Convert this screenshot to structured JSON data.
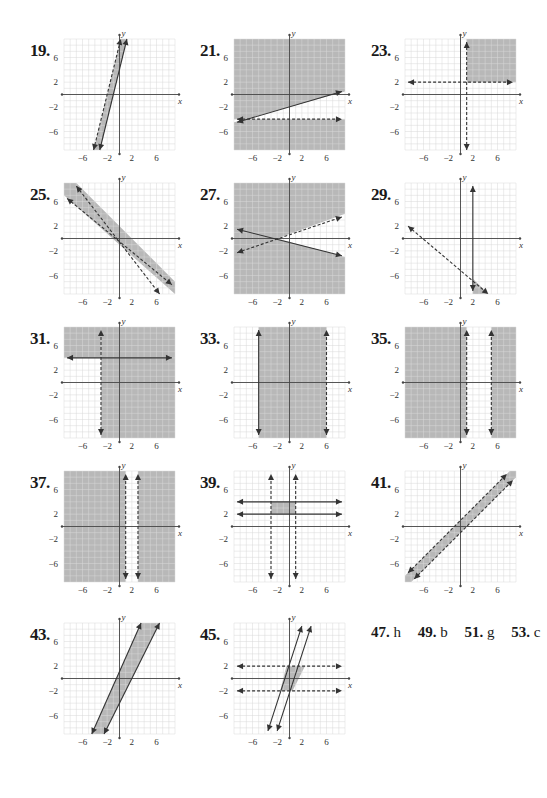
{
  "page": {
    "colors": {
      "shade": "#b8b8b8",
      "grid": "#d9d9d9",
      "axis": "#444444",
      "line": "#333333"
    }
  },
  "graph_settings": {
    "range": [
      -9,
      9
    ],
    "tick_labels_x": [
      "−6",
      "−2",
      "2",
      "6"
    ],
    "tick_values_x": [
      -6,
      -2,
      2,
      6
    ],
    "tick_labels_y": [
      "6",
      "2",
      "−2",
      "−6"
    ],
    "tick_values_y": [
      6,
      2,
      -2,
      -6
    ],
    "x_axis_label": "x",
    "y_axis_label": "y"
  },
  "problems": [
    {
      "number": "19.",
      "col": 0,
      "row": 0,
      "shade": [
        [
          [
            -4.2,
            -9
          ],
          [
            -3.2,
            -9
          ],
          [
            1.2,
            9
          ],
          [
            0.2,
            9
          ]
        ]
      ],
      "lines": [
        {
          "p1": [
            -4.2,
            -9
          ],
          "p2": [
            0.2,
            9
          ],
          "dashed": true
        },
        {
          "p1": [
            -3.2,
            -9
          ],
          "p2": [
            1.2,
            9
          ],
          "dashed": false
        }
      ]
    },
    {
      "number": "21.",
      "col": 1,
      "row": 0,
      "shade": [
        [
          [
            -9,
            9
          ],
          [
            9,
            9
          ],
          [
            9,
            0.5
          ],
          [
            -9,
            -4.5
          ],
          [
            -9,
            -4
          ]
        ],
        [
          [
            -9,
            -4.5
          ],
          [
            -9,
            -9
          ],
          [
            9,
            -9
          ],
          [
            9,
            -4
          ]
        ]
      ],
      "shade_full": true,
      "unshade": [
        [
          [
            -9,
            -4.5
          ],
          [
            9,
            0.5
          ],
          [
            9,
            -4
          ],
          [
            -9,
            -4
          ]
        ]
      ],
      "lines": [
        {
          "p1": [
            -8.5,
            -4.5
          ],
          "p2": [
            8.5,
            0.5
          ],
          "dashed": false
        },
        {
          "p1": [
            -8.5,
            -4
          ],
          "p2": [
            8.5,
            -4
          ],
          "dashed": true
        }
      ]
    },
    {
      "number": "23.",
      "col": 2,
      "row": 0,
      "shade": [
        [
          [
            1,
            2
          ],
          [
            9,
            2
          ],
          [
            9,
            9
          ],
          [
            1,
            9
          ]
        ]
      ],
      "lines": [
        {
          "p1": [
            -8.5,
            2
          ],
          "p2": [
            8.5,
            2
          ],
          "dashed": true
        },
        {
          "p1": [
            1,
            -9
          ],
          "p2": [
            1,
            8.5
          ],
          "dashed": true
        }
      ]
    },
    {
      "number": "25.",
      "col": 0,
      "row": 1,
      "shade": [
        [
          [
            -9,
            9
          ],
          [
            -7,
            9
          ],
          [
            9,
            -7
          ],
          [
            9,
            -9
          ],
          [
            -9,
            7
          ]
        ]
      ],
      "lines": [
        {
          "p1": [
            -7,
            8.5
          ],
          "p2": [
            6.5,
            -9
          ],
          "dashed": true
        },
        {
          "p1": [
            -8.5,
            6.5
          ],
          "p2": [
            8.5,
            -7.5
          ],
          "dashed": true
        }
      ]
    },
    {
      "number": "27.",
      "col": 1,
      "row": 1,
      "shade": [
        [
          [
            -9,
            9
          ],
          [
            9,
            9
          ],
          [
            9,
            4
          ],
          [
            -2,
            0
          ],
          [
            9,
            -3
          ],
          [
            9,
            -9
          ],
          [
            -9,
            -9
          ]
        ]
      ],
      "lines": [
        {
          "p1": [
            -8.5,
            1.5
          ],
          "p2": [
            8.5,
            -2.8
          ],
          "dashed": false
        },
        {
          "p1": [
            -8.5,
            -2.3
          ],
          "p2": [
            8.5,
            3.5
          ],
          "dashed": true
        }
      ]
    },
    {
      "number": "29.",
      "col": 2,
      "row": 1,
      "shade": [
        [
          [
            2,
            -6.5
          ],
          [
            2,
            -9
          ],
          [
            4.5,
            -9
          ]
        ]
      ],
      "lines": [
        {
          "p1": [
            -8.5,
            2
          ],
          "p2": [
            4.5,
            -9
          ],
          "dashed": true
        },
        {
          "p1": [
            2,
            -8.5
          ],
          "p2": [
            2,
            8.5
          ],
          "dashed": false
        }
      ]
    },
    {
      "number": "31.",
      "col": 0,
      "row": 2,
      "shade": [
        [
          [
            -9,
            9
          ],
          [
            9,
            9
          ],
          [
            9,
            -9
          ],
          [
            -3,
            -9
          ],
          [
            -3,
            4
          ],
          [
            -9,
            4
          ]
        ]
      ],
      "lines": [
        {
          "p1": [
            -3,
            -8.5
          ],
          "p2": [
            -3,
            8.5
          ],
          "dashed": true
        },
        {
          "p1": [
            -8.5,
            4
          ],
          "p2": [
            8.5,
            4
          ],
          "dashed": false
        }
      ]
    },
    {
      "number": "33.",
      "col": 1,
      "row": 2,
      "shade": [
        [
          [
            -5,
            9
          ],
          [
            6,
            9
          ],
          [
            6,
            -9
          ],
          [
            -5,
            -9
          ]
        ]
      ],
      "lines": [
        {
          "p1": [
            -5,
            -8.5
          ],
          "p2": [
            -5,
            8.5
          ],
          "dashed": false
        },
        {
          "p1": [
            6,
            -8.5
          ],
          "p2": [
            6,
            8.5
          ],
          "dashed": true
        }
      ]
    },
    {
      "number": "35.",
      "col": 2,
      "row": 2,
      "shade": [
        [
          [
            -9,
            9
          ],
          [
            1,
            9
          ],
          [
            1,
            -9
          ],
          [
            -9,
            -9
          ]
        ],
        [
          [
            5,
            9
          ],
          [
            9,
            9
          ],
          [
            9,
            -9
          ],
          [
            5,
            -9
          ]
        ]
      ],
      "lines": [
        {
          "p1": [
            1,
            -8.5
          ],
          "p2": [
            1,
            8.5
          ],
          "dashed": true
        },
        {
          "p1": [
            5,
            -8.5
          ],
          "p2": [
            5,
            8.5
          ],
          "dashed": true
        }
      ]
    },
    {
      "number": "37.",
      "col": 0,
      "row": 3,
      "shade": [
        [
          [
            -9,
            9
          ],
          [
            1,
            9
          ],
          [
            1,
            -9
          ],
          [
            -9,
            -9
          ]
        ],
        [
          [
            3,
            9
          ],
          [
            9,
            9
          ],
          [
            9,
            -9
          ],
          [
            3,
            -9
          ]
        ]
      ],
      "lines": [
        {
          "p1": [
            1,
            -8.5
          ],
          "p2": [
            1,
            8.5
          ],
          "dashed": true
        },
        {
          "p1": [
            3,
            -8.5
          ],
          "p2": [
            3,
            8.5
          ],
          "dashed": true
        }
      ]
    },
    {
      "number": "39.",
      "col": 1,
      "row": 3,
      "shade": [
        [
          [
            -3,
            2
          ],
          [
            1,
            2
          ],
          [
            1,
            4
          ],
          [
            -3,
            4
          ]
        ]
      ],
      "lines": [
        {
          "p1": [
            -3,
            -8.5
          ],
          "p2": [
            -3,
            8.5
          ],
          "dashed": true
        },
        {
          "p1": [
            1,
            -8.5
          ],
          "p2": [
            1,
            8.5
          ],
          "dashed": true
        },
        {
          "p1": [
            -8.5,
            4
          ],
          "p2": [
            8.5,
            4
          ],
          "dashed": false
        },
        {
          "p1": [
            -8.5,
            2
          ],
          "p2": [
            8.5,
            2
          ],
          "dashed": false
        }
      ]
    },
    {
      "number": "41.",
      "col": 2,
      "row": 3,
      "shade": [
        [
          [
            -9,
            -8
          ],
          [
            -9,
            -9
          ],
          [
            -8,
            -9
          ],
          [
            9,
            8
          ],
          [
            9,
            9
          ],
          [
            8,
            9
          ]
        ]
      ],
      "lines": [
        {
          "p1": [
            -8.5,
            -7.5
          ],
          "p2": [
            7.5,
            8.5
          ],
          "dashed": true
        },
        {
          "p1": [
            -7.5,
            -8.5
          ],
          "p2": [
            8.5,
            7.5
          ],
          "dashed": true
        }
      ]
    },
    {
      "number": "43.",
      "col": 0,
      "row": 4,
      "shade": [
        [
          [
            -4.5,
            -9
          ],
          [
            -2.5,
            -9
          ],
          [
            6.5,
            9
          ],
          [
            3.5,
            9
          ]
        ]
      ],
      "lines": [
        {
          "p1": [
            -4.5,
            -9
          ],
          "p2": [
            3.5,
            9
          ],
          "dashed": false
        },
        {
          "p1": [
            -2.5,
            -9
          ],
          "p2": [
            6.5,
            9
          ],
          "dashed": false
        }
      ]
    },
    {
      "number": "45.",
      "col": 1,
      "row": 4,
      "shade": [
        [
          [
            -1.5,
            -2
          ],
          [
            0.5,
            -2
          ],
          [
            2.5,
            2
          ],
          [
            -0.5,
            2
          ]
        ]
      ],
      "lines": [
        {
          "p1": [
            -3.5,
            -8.5
          ],
          "p2": [
            2,
            8.5
          ],
          "dashed": false
        },
        {
          "p1": [
            -2,
            -8.5
          ],
          "p2": [
            3.5,
            8.5
          ],
          "dashed": false
        },
        {
          "p1": [
            -8.5,
            2
          ],
          "p2": [
            8.5,
            2
          ],
          "dashed": true
        },
        {
          "p1": [
            -8.5,
            -2
          ],
          "p2": [
            8.5,
            -2
          ],
          "dashed": true
        }
      ]
    }
  ],
  "answers": [
    {
      "num": "47.",
      "val": "h"
    },
    {
      "num": "49.",
      "val": "b"
    },
    {
      "num": "51.",
      "val": "g"
    },
    {
      "num": "53.",
      "val": "c"
    }
  ],
  "chart_data": [
    {
      "type": "scatter",
      "title": "19.",
      "xlabel": "x",
      "ylabel": "y",
      "xlim": [
        -9,
        9
      ],
      "ylim": [
        -9,
        9
      ],
      "grid": true,
      "annotations": [
        "dashed line and solid line, steep positive slope, narrow shaded strip between"
      ]
    },
    {
      "type": "scatter",
      "title": "21.",
      "xlabel": "x",
      "ylabel": "y",
      "xlim": [
        -9,
        9
      ],
      "ylim": [
        -9,
        9
      ],
      "grid": true,
      "annotations": [
        "solid line from (-9,-4.5) to (9,0.5)",
        "dashed horizontal line y=-4",
        "shaded above solid line and below dashed line"
      ]
    },
    {
      "type": "scatter",
      "title": "23.",
      "xlabel": "x",
      "ylabel": "y",
      "xlim": [
        -9,
        9
      ],
      "ylim": [
        -9,
        9
      ],
      "grid": true,
      "annotations": [
        "dashed y=2",
        "dashed x=1",
        "shaded region x>1, y>2"
      ]
    },
    {
      "type": "scatter",
      "title": "25.",
      "xlabel": "x",
      "ylabel": "y",
      "xlim": [
        -9,
        9
      ],
      "ylim": [
        -9,
        9
      ],
      "grid": true,
      "annotations": [
        "two parallel dashed lines slope -1, shaded strip between"
      ]
    },
    {
      "type": "scatter",
      "title": "27.",
      "xlabel": "x",
      "ylabel": "y",
      "xlim": [
        -9,
        9
      ],
      "ylim": [
        -9,
        9
      ],
      "grid": true,
      "annotations": [
        "solid line negative slope through (-2,0)",
        "dashed line positive slope through (-2,0)",
        "shaded everywhere except right wedge"
      ]
    },
    {
      "type": "scatter",
      "title": "29.",
      "xlabel": "x",
      "ylabel": "y",
      "xlim": [
        -9,
        9
      ],
      "ylim": [
        -9,
        9
      ],
      "grid": true,
      "annotations": [
        "dashed line from (-8,2) to (4.5,-9)",
        "solid x=2",
        "small shaded triangle near (2..4.5,-9..-6.5)"
      ]
    },
    {
      "type": "scatter",
      "title": "31.",
      "xlabel": "x",
      "ylabel": "y",
      "xlim": [
        -9,
        9
      ],
      "ylim": [
        -9,
        9
      ],
      "grid": true,
      "annotations": [
        "dashed x=-3",
        "solid y=4",
        "shaded x>-3 or y>4"
      ]
    },
    {
      "type": "scatter",
      "title": "33.",
      "xlabel": "x",
      "ylabel": "y",
      "xlim": [
        -9,
        9
      ],
      "ylim": [
        -9,
        9
      ],
      "grid": true,
      "annotations": [
        "solid x=-5",
        "dashed x=6",
        "shaded between"
      ]
    },
    {
      "type": "scatter",
      "title": "35.",
      "xlabel": "x",
      "ylabel": "y",
      "xlim": [
        -9,
        9
      ],
      "ylim": [
        -9,
        9
      ],
      "grid": true,
      "annotations": [
        "dashed x=1",
        "dashed x=5",
        "shaded x<1 or x>5"
      ]
    },
    {
      "type": "scatter",
      "title": "37.",
      "xlabel": "x",
      "ylabel": "y",
      "xlim": [
        -9,
        9
      ],
      "ylim": [
        -9,
        9
      ],
      "grid": true,
      "annotations": [
        "dashed x=1",
        "dashed x=3",
        "shaded x<1 or x>3"
      ]
    },
    {
      "type": "scatter",
      "title": "39.",
      "xlabel": "x",
      "ylabel": "y",
      "xlim": [
        -9,
        9
      ],
      "ylim": [
        -9,
        9
      ],
      "grid": true,
      "annotations": [
        "dashed x=-3, dashed x=1",
        "solid y=2, solid y=4",
        "shaded rectangle -3<x<1, 2<=y<=4"
      ]
    },
    {
      "type": "scatter",
      "title": "41.",
      "xlabel": "x",
      "ylabel": "y",
      "xlim": [
        -9,
        9
      ],
      "ylim": [
        -9,
        9
      ],
      "grid": true,
      "annotations": [
        "two parallel dashed lines slope 1, shaded strip between"
      ]
    },
    {
      "type": "scatter",
      "title": "43.",
      "xlabel": "x",
      "ylabel": "y",
      "xlim": [
        -9,
        9
      ],
      "ylim": [
        -9,
        9
      ],
      "grid": true,
      "annotations": [
        "two parallel solid lines slope ~2, shaded strip between"
      ]
    },
    {
      "type": "scatter",
      "title": "45.",
      "xlabel": "x",
      "ylabel": "y",
      "xlim": [
        -9,
        9
      ],
      "ylim": [
        -9,
        9
      ],
      "grid": true,
      "annotations": [
        "two parallel solid lines slope ~3",
        "dashed y=2 and y=-2",
        "shaded parallelogram"
      ]
    }
  ]
}
